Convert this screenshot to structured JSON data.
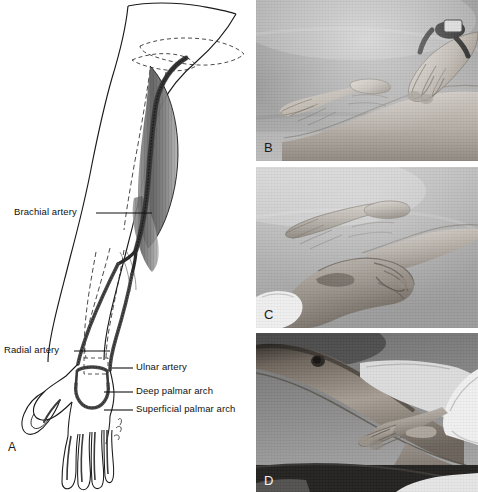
{
  "figure": {
    "type": "medical-illustration"
  },
  "panel_a": {
    "letter": "A",
    "kind": "line-drawing",
    "labels": [
      {
        "id": "brachial",
        "text": "Brachial artery",
        "x": 14,
        "y": 207,
        "line_x1": 96,
        "line_x2": 152,
        "line_y": 213
      },
      {
        "id": "radial",
        "text": "Radial artery",
        "x": 4,
        "y": 345,
        "line_x1": 74,
        "line_x2": 110,
        "line_y": 351
      },
      {
        "id": "ulnar",
        "text": "Ulnar artery",
        "x": 136,
        "y": 362,
        "line_x1": 112,
        "line_x2": 133,
        "line_y": 368
      },
      {
        "id": "deep-arch",
        "text": "Deep palmar arch",
        "x": 136,
        "y": 386,
        "line_x1": 104,
        "line_x2": 133,
        "line_y": 392
      },
      {
        "id": "super-arch",
        "text": "Superficial palmar arch",
        "x": 136,
        "y": 404,
        "line_x1": 104,
        "line_x2": 133,
        "line_y": 410
      }
    ]
  },
  "panel_b": {
    "letter": "B",
    "kind": "photograph",
    "scene": "Examiner's fingertips palpating the radial pulse at the lateral volar wrist of a supinated hand; examiner wears a wristwatch"
  },
  "panel_c": {
    "letter": "C",
    "kind": "photograph",
    "scene": "Examiner's hand palpating the ulnar pulse at the medial volar wrist of a supinated hand; white cuff at examiner's wrist"
  },
  "panel_d": {
    "letter": "D",
    "kind": "photograph",
    "scene": "Examiner's fingertips palpating the brachial pulse in the antecubital fossa of an extended arm; white lab-coat sleeve visible"
  },
  "colors": {
    "page_background": "#ffffff",
    "ink": "#111111",
    "photo_mid_gray": "#8e8e8e",
    "photo_light_gray": "#c9c9c9",
    "photo_dark_gray": "#3a3a3a",
    "skin_gray": "#a9a39c"
  }
}
